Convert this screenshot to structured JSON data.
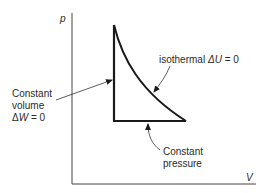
{
  "diagram": {
    "axes": {
      "y_label": "p",
      "x_label": "V"
    },
    "labels": {
      "isothermal": {
        "text_prefix": "isothermal ",
        "delta": "Δ",
        "variable": "U",
        "equals": " = 0"
      },
      "constant_volume": {
        "line1": "Constant",
        "line2": "volume",
        "delta": "Δ",
        "variable": "W",
        "equals": " = 0"
      },
      "constant_pressure": {
        "line1": "Constant",
        "line2": "pressure"
      }
    },
    "colors": {
      "line": "#1a1a1a",
      "axis": "#333333",
      "text": "#2a2a2a"
    }
  }
}
